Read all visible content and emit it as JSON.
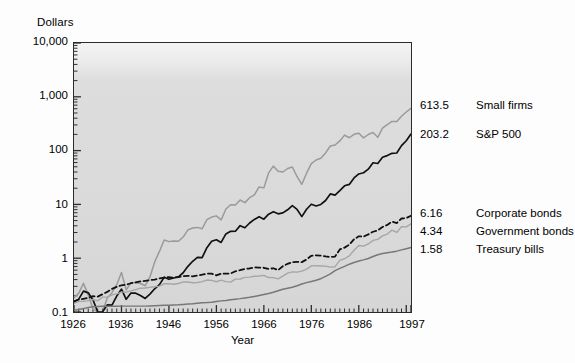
{
  "chart_data": {
    "type": "line",
    "title": "",
    "xlabel": "Year",
    "ylabel": "Dollars",
    "yscale": "log",
    "ylim": [
      0.1,
      10000
    ],
    "xlim": [
      1926,
      1997
    ],
    "ytick_labels": [
      "10,000",
      "1,000",
      "100",
      "10",
      "1",
      "0.1"
    ],
    "ytick_values": [
      10000,
      1000,
      100,
      10,
      1,
      0.1
    ],
    "xtick_labels": [
      "1926",
      "1936",
      "1946",
      "1956",
      "1966",
      "1976",
      "1986",
      "1997"
    ],
    "xtick_values": [
      1926,
      1936,
      1946,
      1956,
      1966,
      1976,
      1986,
      1997
    ],
    "grid": false,
    "legend_position": "right-endpoint-labels",
    "years": [
      1926,
      1927,
      1928,
      1929,
      1930,
      1931,
      1932,
      1933,
      1934,
      1935,
      1936,
      1937,
      1938,
      1939,
      1940,
      1941,
      1942,
      1943,
      1944,
      1945,
      1946,
      1947,
      1948,
      1949,
      1950,
      1951,
      1952,
      1953,
      1954,
      1955,
      1956,
      1957,
      1958,
      1959,
      1960,
      1961,
      1962,
      1963,
      1964,
      1965,
      1966,
      1967,
      1968,
      1969,
      1970,
      1971,
      1972,
      1973,
      1974,
      1975,
      1976,
      1977,
      1978,
      1979,
      1980,
      1981,
      1982,
      1983,
      1984,
      1985,
      1986,
      1987,
      1988,
      1989,
      1990,
      1991,
      1992,
      1993,
      1994,
      1995,
      1996,
      1997
    ],
    "series": [
      {
        "name": "Small firms",
        "end_value": 613.5,
        "end_label": "613.5",
        "color": "#9a9a9a",
        "style": "solid",
        "width": 1.5,
        "values": [
          1.0,
          1.22,
          1.85,
          1.12,
          0.62,
          0.31,
          0.33,
          0.99,
          1.24,
          1.75,
          2.96,
          1.4,
          1.9,
          1.91,
          1.84,
          1.67,
          2.44,
          4.64,
          7.27,
          11.88,
          11.05,
          11.38,
          11.21,
          13.45,
          18.25,
          19.84,
          20.33,
          19.18,
          28.31,
          31.65,
          33.25,
          27.98,
          44.74,
          53.52,
          53.2,
          65.69,
          58.66,
          72.41,
          82.14,
          114.61,
          110.24,
          209.2,
          279.77,
          225.12,
          217.4,
          252.66,
          269.05,
          177.82,
          128.47,
          206.83,
          311.05,
          363.96,
          392.28,
          492.96,
          661.07,
          690.82,
          823.0,
          1053.87,
          941.86,
          1092.03,
          1146.63,
          937.48,
          1083.41,
          1184.84,
          958.71,
          1419.93,
          1657.2,
          1892.77,
          1884.58,
          2370.1,
          2832.35,
          3336.0
        ],
        "display_scaled_note": "values shown rescaled to end at 613.5"
      },
      {
        "name": "S&P 500",
        "end_value": 203.2,
        "end_label": "203.2",
        "color": "#111111",
        "style": "solid",
        "width": 1.7,
        "values": [
          1.0,
          1.14,
          1.6,
          1.49,
          1.1,
          0.63,
          0.58,
          0.89,
          0.88,
          1.3,
          1.74,
          1.13,
          1.48,
          1.47,
          1.33,
          1.17,
          1.41,
          1.77,
          2.12,
          2.9,
          2.66,
          2.81,
          2.96,
          3.52,
          4.63,
          5.75,
          6.81,
          6.75,
          10.3,
          13.56,
          14.45,
          12.9,
          18.51,
          20.73,
          20.83,
          26.42,
          24.12,
          29.62,
          34.5,
          38.81,
          34.9,
          43.25,
          47.97,
          43.88,
          45.64,
          52.14,
          62.02,
          52.9,
          38.89,
          53.37,
          66.11,
          61.38,
          65.4,
          77.53,
          102.67,
          97.62,
          118.6,
          145.37,
          154.52,
          203.57,
          241.46,
          254.17,
          296.21,
          389.63,
          377.51,
          492.36,
          529.91,
          583.37,
          591.11,
          812.94,
          999.66,
          1332.99
        ],
        "display_scaled_note": "values shown rescaled to end at 203.2"
      },
      {
        "name": "Corporate bonds",
        "end_value": 6.16,
        "end_label": "6.16",
        "color": "#111111",
        "style": "dashed",
        "width": 1.8,
        "values": [
          1.0,
          1.07,
          1.11,
          1.15,
          1.24,
          1.22,
          1.35,
          1.49,
          1.69,
          1.85,
          1.98,
          2.03,
          2.16,
          2.25,
          2.33,
          2.4,
          2.46,
          2.53,
          2.65,
          2.76,
          2.8,
          2.73,
          2.82,
          2.91,
          2.97,
          2.9,
          3.01,
          3.11,
          3.27,
          3.25,
          3.02,
          3.26,
          3.25,
          3.28,
          3.6,
          3.77,
          3.98,
          4.06,
          4.25,
          4.23,
          4.19,
          4.0,
          4.1,
          3.79,
          4.47,
          4.96,
          5.32,
          5.38,
          5.33,
          5.97,
          7.0,
          7.12,
          7.07,
          6.79,
          6.59,
          6.78,
          9.19,
          9.92,
          11.22,
          14.18,
          16.07,
          15.88,
          17.48,
          19.57,
          20.78,
          24.0,
          26.22,
          30.18,
          28.41,
          34.51,
          35.1,
          38.85
        ],
        "display_scaled_note": "values shown rescaled to end at 6.16"
      },
      {
        "name": "Government bonds",
        "end_value": 4.34,
        "end_label": "4.34",
        "color": "#a6a6a6",
        "style": "solid",
        "width": 1.4,
        "values": [
          1.0,
          1.09,
          1.09,
          1.13,
          1.18,
          1.12,
          1.31,
          1.31,
          1.44,
          1.51,
          1.62,
          1.62,
          1.71,
          1.81,
          1.92,
          1.94,
          1.99,
          2.04,
          2.1,
          2.33,
          2.33,
          2.27,
          2.35,
          2.51,
          2.51,
          2.42,
          2.45,
          2.54,
          2.72,
          2.68,
          2.53,
          2.71,
          2.55,
          2.49,
          2.83,
          2.85,
          3.05,
          3.09,
          3.2,
          3.23,
          3.33,
          3.03,
          3.02,
          2.87,
          3.22,
          3.65,
          3.86,
          3.82,
          3.99,
          4.35,
          4.99,
          5.03,
          4.97,
          4.93,
          4.73,
          4.82,
          6.3,
          6.77,
          7.66,
          9.74,
          11.95,
          11.63,
          12.75,
          14.86,
          15.49,
          18.02,
          19.46,
          23.06,
          20.88,
          26.73,
          26.56,
          30.09
        ],
        "display_scaled_note": "values shown rescaled to end at 4.34"
      },
      {
        "name": "Treasury bills",
        "end_value": 1.58,
        "end_label": "1.58",
        "color": "#777777",
        "style": "solid",
        "width": 1.5,
        "values": [
          1.0,
          1.03,
          1.07,
          1.12,
          1.16,
          1.17,
          1.18,
          1.18,
          1.18,
          1.18,
          1.19,
          1.19,
          1.19,
          1.19,
          1.19,
          1.19,
          1.2,
          1.21,
          1.22,
          1.23,
          1.24,
          1.25,
          1.26,
          1.28,
          1.3,
          1.32,
          1.35,
          1.38,
          1.39,
          1.41,
          1.45,
          1.49,
          1.51,
          1.56,
          1.6,
          1.64,
          1.69,
          1.74,
          1.8,
          1.87,
          1.96,
          2.05,
          2.16,
          2.3,
          2.45,
          2.56,
          2.66,
          2.85,
          3.07,
          3.25,
          3.41,
          3.59,
          3.85,
          4.25,
          4.73,
          5.43,
          5.99,
          6.52,
          7.16,
          7.71,
          8.18,
          8.62,
          9.16,
          9.93,
          10.7,
          11.29,
          11.69,
          12.03,
          12.51,
          13.21,
          13.89,
          14.62
        ],
        "display_scaled_note": "values shown rescaled to end at 1.58"
      }
    ]
  },
  "axes": {
    "y_title": "Dollars",
    "x_title": "Year"
  },
  "end_labels": [
    {
      "value": "613.5",
      "name": "Small firms"
    },
    {
      "value": "203.2",
      "name": "S&P 500"
    },
    {
      "value": "6.16",
      "name": "Corporate bonds"
    },
    {
      "value": "4.34",
      "name": "Government bonds"
    },
    {
      "value": "1.58",
      "name": "Treasury bills"
    }
  ]
}
